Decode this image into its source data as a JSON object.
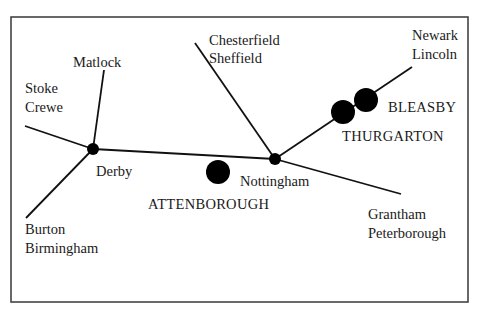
{
  "diagram": {
    "type": "railway-line-schematic",
    "colors": {
      "line": "#111111",
      "frame": "#444444",
      "text": "#1a1a1a",
      "background": "#ffffff"
    },
    "junctions": [
      {
        "name": "Derby",
        "label": "Derby"
      },
      {
        "name": "Nottingham",
        "label": "Nottingham"
      }
    ],
    "stations": [
      {
        "name": "Attenborough",
        "label": "ATTENBOROUGH"
      },
      {
        "name": "Thurgarton",
        "label": "THURGARTON"
      },
      {
        "name": "Bleasby",
        "label": "BLEASBY"
      }
    ],
    "destinations": [
      {
        "id": "stoke-crewe",
        "lines": [
          "Stoke",
          "Crewe"
        ]
      },
      {
        "id": "matlock",
        "lines": [
          "Matlock"
        ]
      },
      {
        "id": "burton-birmingham",
        "lines": [
          "Burton",
          "Birmingham"
        ]
      },
      {
        "id": "chesterfield-sheffield",
        "lines": [
          "Chesterfield",
          "Sheffield"
        ]
      },
      {
        "id": "grantham-peterborough",
        "lines": [
          "Grantham",
          "Peterborough"
        ]
      },
      {
        "id": "newark-lincoln",
        "lines": [
          "Newark",
          "Lincoln"
        ]
      }
    ]
  }
}
